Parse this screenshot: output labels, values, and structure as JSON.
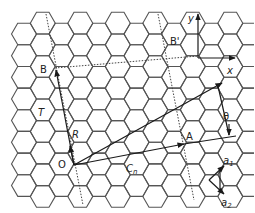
{
  "diagram": {
    "colors": {
      "lattice": "#555555",
      "vectors": "#1a1a1a",
      "text": "#222222",
      "background": "#ffffff"
    },
    "lattice": {
      "hex_radius": 12.5,
      "origin_x": 24,
      "origin_y": 34,
      "cols": 13,
      "rows": 10
    },
    "points": {
      "O": {
        "label": "O",
        "x": 74,
        "y": 165
      },
      "A": {
        "label": "A",
        "x": 184,
        "y": 144
      },
      "B": {
        "label": "B",
        "x": 55,
        "y": 68
      },
      "B_prime": {
        "label": "B'",
        "x": 166,
        "y": 48
      }
    },
    "vectors": {
      "Cn": {
        "label": "C",
        "subscript": "n"
      },
      "T": {
        "label": "T"
      },
      "R": {
        "label": "R"
      },
      "a1": {
        "label": "a",
        "subscript": "1"
      },
      "a2": {
        "label": "a",
        "subscript": "2"
      }
    },
    "axes": {
      "x_label": "x",
      "y_label": "y"
    },
    "angle": {
      "label": "θ"
    }
  }
}
